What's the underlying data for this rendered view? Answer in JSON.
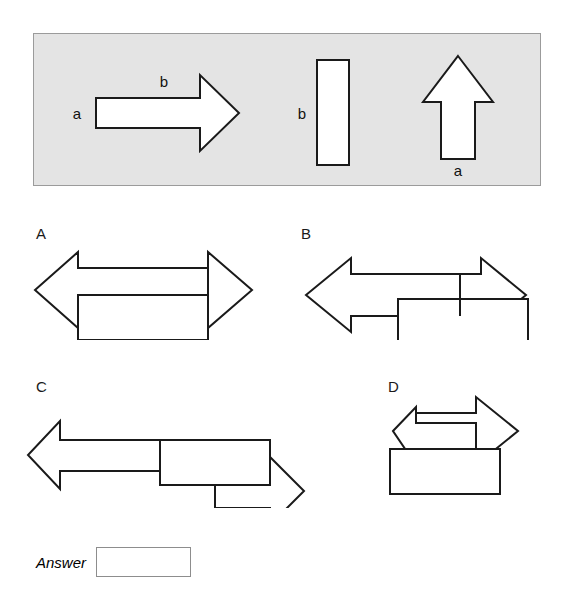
{
  "question": {
    "type": "shape-assembly",
    "stimulus": {
      "background_color": "#e4e4e4",
      "border_color": "#9b9b9b",
      "shapes": [
        {
          "name": "right-arrow",
          "label_height": "a",
          "label_length": "b",
          "direction": "right"
        },
        {
          "name": "tall-rectangle",
          "label_height": "b",
          "label_width": ""
        },
        {
          "name": "up-arrow",
          "label_width": "a",
          "direction": "up"
        }
      ],
      "labels": {
        "arrow_height": "a",
        "arrow_length": "b",
        "rectangle_height": "b",
        "uparrow_width": "a"
      }
    },
    "options": [
      {
        "letter": "A",
        "description": "double-headed horizontal arrow with rectangle overlapping at lower left"
      },
      {
        "letter": "B",
        "description": "double-headed horizontal arrow with rectangle overlapping at lower centre-right"
      },
      {
        "letter": "C",
        "description": "left arrow joined to rectangle with a smaller right arrow stepped below"
      },
      {
        "letter": "D",
        "description": "left arrow with right arrow stepped above and rectangle below"
      }
    ],
    "answer": {
      "label": "Answer",
      "value": "",
      "placeholder": ""
    }
  },
  "colors": {
    "shape_stroke": "#1a1a1a",
    "shape_fill": "#ffffff",
    "panel_fill": "#e4e4e4",
    "text": "#000000"
  }
}
